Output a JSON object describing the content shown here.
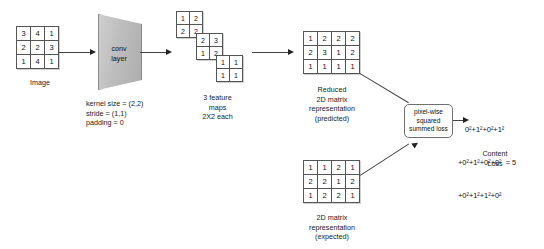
{
  "diagram": {
    "title_semantic": "cnn-content-loss-diagram",
    "input": {
      "label": "Image",
      "matrix": [
        [
          3,
          4,
          1
        ],
        [
          2,
          2,
          3
        ],
        [
          1,
          4,
          1
        ]
      ]
    },
    "conv": {
      "label_line1": "conv",
      "label_line2": "layer",
      "params": "kernel size = (2,2)\nstride = (1,1)\npadding = 0"
    },
    "feature_maps": {
      "caption": "3 feature\nmaps\n2X2 each",
      "maps": [
        [
          [
            1,
            2
          ],
          [
            2,
            2
          ]
        ],
        [
          [
            2,
            3
          ],
          [
            1,
            2
          ]
        ],
        [
          [
            1,
            1
          ],
          [
            1,
            1
          ]
        ]
      ]
    },
    "predicted": {
      "caption": "Reduced\n2D matrix\nrepresentation\n(predicted)",
      "matrix": [
        [
          1,
          2,
          2,
          2
        ],
        [
          2,
          3,
          1,
          2
        ],
        [
          1,
          1,
          1,
          1
        ]
      ]
    },
    "expected": {
      "caption": "2D matrix\nrepresentation\n(expected)",
      "matrix": [
        [
          1,
          1,
          2,
          1
        ],
        [
          2,
          2,
          1,
          2
        ],
        [
          1,
          2,
          2,
          1
        ]
      ]
    },
    "loss_box": {
      "label": "pixel-wise\nsquared\nsummed loss"
    },
    "formula": {
      "line1": "0²+1²+0²+1²",
      "line2": "+0²+1²+0²+0²  = 5",
      "line3": "+0²+1²+1²+0²",
      "result": "5"
    },
    "content_loss_label": "Content\nLoss"
  },
  "colors": {
    "stroke": "#444444",
    "matrix_border": "#555555",
    "conv_fill": "#bdbdbd",
    "background": "#ffffff",
    "text": "#1a1a1a"
  }
}
